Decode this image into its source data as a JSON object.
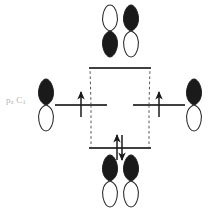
{
  "figure": {
    "type": "molecular-orbital-interaction-diagram",
    "background_color": "#ffffff",
    "line_color": "#404040",
    "lobe_fill_color": "#1a1a1a",
    "lobe_empty_color": "#ffffff",
    "dashed_color": "#555555",
    "label_color": "#b4b4b4"
  },
  "labels": {
    "atomic_orbital_label": "p",
    "atomic_orbital_sub_1": "z",
    "atomic_orbital_label_2": "C",
    "atomic_orbital_sub_2": "1",
    "atomic_orbital_full": "pz C1"
  },
  "levels": {
    "antibonding": {
      "name": "antibonding",
      "electron_count": 0,
      "arrows": [],
      "y": 68,
      "x_center": 120,
      "width": 62
    },
    "left_atomic": {
      "name": "left-atomic-orbital-level",
      "electron_count": 1,
      "arrows": [
        "up"
      ],
      "y": 105,
      "x_center": 80,
      "width": 52
    },
    "right_atomic": {
      "name": "right-atomic-orbital-level",
      "electron_count": 1,
      "arrows": [
        "up"
      ],
      "y": 105,
      "x_center": 160,
      "width": 52
    },
    "bonding": {
      "name": "bonding",
      "electron_count": 2,
      "arrows": [
        "up",
        "down"
      ],
      "y": 148,
      "x_center": 120,
      "width": 62
    }
  },
  "orbitals": {
    "antibonding_pair": {
      "name": "antibonding-orbital-pair",
      "phase": "out-of-phase",
      "left_lobe": {
        "top": "empty",
        "bottom": "filled"
      },
      "right_lobe": {
        "top": "filled",
        "bottom": "empty"
      }
    },
    "bonding_pair": {
      "name": "bonding-orbital-pair",
      "phase": "in-phase",
      "left_lobe": {
        "top": "filled",
        "bottom": "empty"
      },
      "right_lobe": {
        "top": "filled",
        "bottom": "empty"
      }
    },
    "left_atomic_orbital": {
      "name": "left-p-orbital",
      "top": "filled",
      "bottom": "empty"
    },
    "right_atomic_orbital": {
      "name": "right-p-orbital",
      "top": "filled",
      "bottom": "empty"
    }
  },
  "correlation_lines": {
    "style": "dashed",
    "count": 4,
    "shape": "diamond"
  }
}
